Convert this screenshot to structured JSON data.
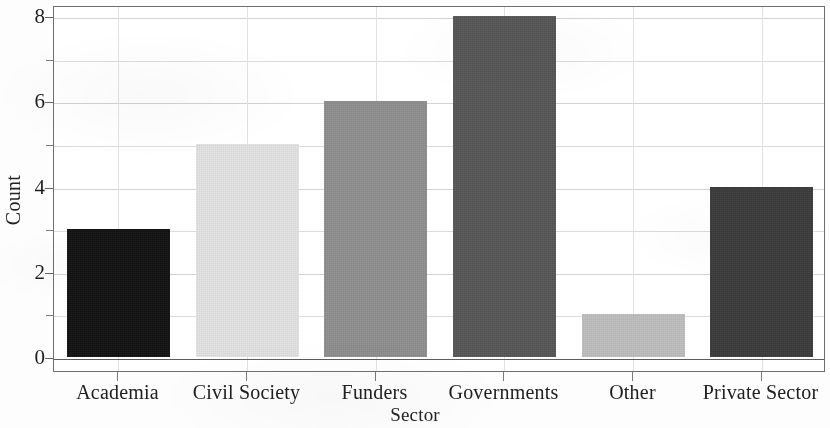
{
  "chart_data": {
    "type": "bar",
    "title": "",
    "subtitle": "",
    "xlabel": "Sector",
    "ylabel": "Count",
    "categories": [
      "Academia",
      "Civil Society",
      "Funders",
      "Governments",
      "Other",
      "Private Sector"
    ],
    "values": [
      3,
      5,
      6,
      8,
      1,
      4
    ],
    "series": [
      {
        "name": "Count",
        "values": [
          3,
          5,
          6,
          8,
          1,
          4
        ]
      }
    ],
    "bar_colors": [
      "#111111",
      "#e2e2e2",
      "#8e8e8e",
      "#565656",
      "#bdbdbd",
      "#3b3b3b"
    ],
    "ylim": [
      0,
      8.35
    ],
    "xlim_categories": 6,
    "y_major_ticks": [
      0,
      2,
      4,
      6,
      8
    ],
    "y_major_tick_labels": [
      "0",
      "2",
      "4",
      "6",
      "8"
    ],
    "y_minor_ticks": [
      1,
      3,
      5,
      7
    ],
    "grid": {
      "horizontal": true,
      "vertical": true,
      "color": "#dcdcdc"
    },
    "legend": {
      "visible": false,
      "position": "none",
      "entries": []
    },
    "annotations": [],
    "axis_frame": true,
    "background_color": "#ffffff",
    "axis_color": "#6f6f6f",
    "text_color": "#1f1f1f"
  }
}
